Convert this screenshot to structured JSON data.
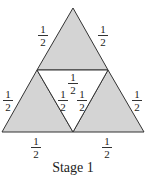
{
  "diagram": {
    "fill_color": "#d4d4d4",
    "stroke_color": "#333333",
    "vertices": {
      "apex": [
        73,
        8
      ],
      "bottom_left": [
        2,
        132
      ],
      "bottom_right": [
        144,
        132
      ],
      "mid_left": [
        37,
        70
      ],
      "mid_right": [
        108,
        70
      ],
      "mid_bottom": [
        73,
        132
      ]
    },
    "shaded_triangles": [
      "top",
      "bottom-left",
      "bottom-right"
    ],
    "unshaded_triangles": [
      "center"
    ],
    "labels": [
      {
        "id": "top-left-edge",
        "num": "1",
        "den": "2"
      },
      {
        "id": "top-right-edge",
        "num": "1",
        "den": "2"
      },
      {
        "id": "center-top-edge",
        "num": "1",
        "den": "2"
      },
      {
        "id": "left-outer-edge",
        "num": "1",
        "den": "2"
      },
      {
        "id": "left-inner-edge",
        "num": "1",
        "den": "2"
      },
      {
        "id": "right-inner-edge",
        "num": "1",
        "den": "2"
      },
      {
        "id": "right-outer-edge",
        "num": "1",
        "den": "2"
      },
      {
        "id": "bottom-left-edge",
        "num": "1",
        "den": "2"
      },
      {
        "id": "bottom-right-edge",
        "num": "1",
        "den": "2"
      }
    ],
    "caption": "Stage 1"
  }
}
